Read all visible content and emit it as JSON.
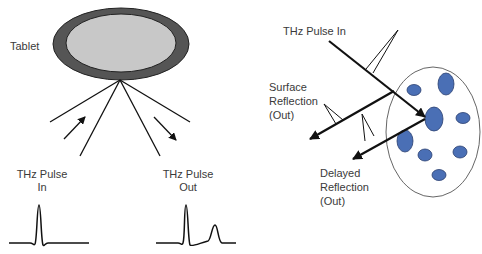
{
  "left_panel": {
    "tablet_label": "Tablet",
    "pulse_in_label_line1": "THz Pulse",
    "pulse_in_label_line2": "In",
    "pulse_out_label_line1": "THz Pulse",
    "pulse_out_label_line2": "Out"
  },
  "right_panel": {
    "pulse_in_label": "THz Pulse In",
    "surface_reflection_line1": "Surface",
    "surface_reflection_line2": "Reflection",
    "surface_reflection_line3": "(Out)",
    "delayed_reflection_line1": "Delayed",
    "delayed_reflection_line2": "Reflection",
    "delayed_reflection_line3": "(Out)"
  },
  "colors": {
    "tablet_rim": "#555555",
    "tablet_face": "#c8c8c8",
    "particle_fill": "#4a6fb5",
    "line": "#111111"
  }
}
